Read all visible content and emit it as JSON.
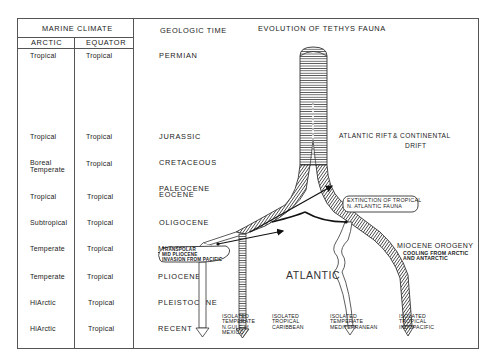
{
  "table": {
    "group_header": "MARINE CLIMATE",
    "col_arctic": "ARCTIC",
    "col_equator": "EQUATOR",
    "col_time": "GEOLOGIC TIME",
    "rows": [
      {
        "arctic": "Tropical",
        "equator": "Tropical",
        "time": "PERMIAN"
      },
      {
        "arctic": "Tropical",
        "equator": "Tropical",
        "time": "JURASSIC"
      },
      {
        "arctic": "Boreal Temperate",
        "arctic_line1": "Boreal",
        "arctic_line2": "Temperate",
        "equator": "Tropical",
        "time": "CRETACEOUS"
      },
      {
        "arctic": "Tropical",
        "equator": "Tropical",
        "time": "PALEOCENE EOCENE",
        "time_line1": "PALEOCENE",
        "time_line2": "EOCENE"
      },
      {
        "arctic": "Subtropical",
        "equator": "Tropical",
        "time": "OLIGOCENE"
      },
      {
        "arctic": "Temperate",
        "equator": "Tropical",
        "time": "MIOCENE"
      },
      {
        "arctic": "Temperate",
        "equator": "Tropical",
        "time": "PLIOCENE"
      },
      {
        "arctic": "HiArctic",
        "equator": "Tropical",
        "time": "PLEISTOCENE"
      },
      {
        "arctic": "HiArctic",
        "equator": "Tropical",
        "time": "RECENT"
      }
    ]
  },
  "diagram": {
    "title": "EVOLUTION OF TETHYS FAUNA",
    "labels": {
      "rift_line1": "ATLANTIC RIFT",
      "rift_line2": "& CONTINENTAL",
      "rift_line3": "DRIFT",
      "extinction_line1": "EXTINCTION OF TROPICAL",
      "extinction_line2": "N. ATLANTIC FAUNA",
      "orogeny_title": "MIOCENE OROGENY",
      "orogeny_line1": "COOLING FROM ARCTIC",
      "orogeny_line2": "AND ANTARCTIC",
      "transpolar_line1": "TRANSPOLAR",
      "transpolar_line2": "MID PLIOCENE",
      "transpolar_line3": "INVASION FROM PACIFIC",
      "atlantic": "ATLANTIC"
    },
    "outcomes": [
      {
        "line1": "ISOLATED",
        "line2": "TEMPERATE",
        "line3": "N.GULF of",
        "line4": "MEXICO"
      },
      {
        "line1": "ISOLATED",
        "line2": "TROPICAL",
        "line3": "CARIBBEAN"
      },
      {
        "line1": "ISOLATED",
        "line2": "TEMPERATE",
        "line3": "MEDITERRANEAN"
      },
      {
        "line1": "ISOLATED",
        "line2": "TROPICAL",
        "line3": "INDOPACIFIC"
      }
    ]
  }
}
